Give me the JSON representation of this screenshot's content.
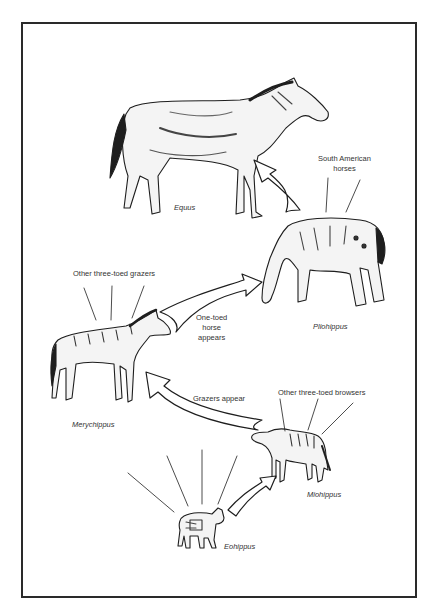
{
  "diagram": {
    "title": "",
    "species": [
      {
        "id": "equus",
        "name": "Equus"
      },
      {
        "id": "pliohippus",
        "name": "Pliohippus"
      },
      {
        "id": "merychippus",
        "name": "Merychippus"
      },
      {
        "id": "miohippus",
        "name": "Miohippus"
      },
      {
        "id": "eohippus",
        "name": "Eohippus"
      }
    ],
    "annotations": {
      "south_american": [
        "South American",
        "horses"
      ],
      "three_toed_grazers": "Other three-toed grazers",
      "one_toed": [
        "One-toed",
        "horse",
        "appears"
      ],
      "grazers_appear": "Grazers appear",
      "three_toed_browsers": "Other three-toed browsers"
    },
    "arrows": [
      {
        "from": "Eohippus",
        "to": "Miohippus"
      },
      {
        "from": "Miohippus",
        "to": "Merychippus",
        "label": "Grazers appear"
      },
      {
        "from": "Merychippus",
        "to": "Pliohippus",
        "label": "One-toed horse appears"
      },
      {
        "from": "Pliohippus",
        "to": "Equus"
      }
    ],
    "colors": {
      "ink": "#1e1e1e",
      "paper": "#ffffff",
      "frame": "#2a2a2a"
    }
  }
}
